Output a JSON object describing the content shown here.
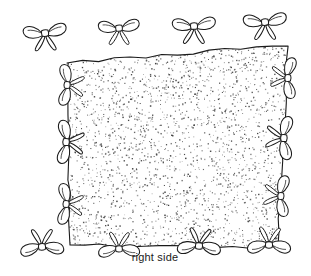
{
  "figure": {
    "caption": "right side",
    "caption_position": {
      "x": 155,
      "y": 261
    },
    "background_color": "#ffffff",
    "ink_color": "#1a1a1a",
    "stipple_color": "#3c3c3c",
    "line_width": 1.1
  },
  "panel": {
    "name": "stippled-fabric-panel",
    "description": "Rectangular fabric piece with hand-drawn wavy outline and dense random stipple fill",
    "fill": "#ffffff",
    "stipple_dot_count": 2400,
    "stipple_dot_size": 1.0,
    "corners": [
      {
        "name": "top-left",
        "x": 67,
        "y": 63
      },
      {
        "name": "top-right",
        "x": 288,
        "y": 45
      },
      {
        "name": "bottom-right",
        "x": 277,
        "y": 247
      },
      {
        "name": "bottom-left",
        "x": 70,
        "y": 245
      }
    ]
  },
  "bows": {
    "count_total": 14,
    "edges": [
      {
        "edge": "top",
        "count": 4,
        "orientation": "horizontal",
        "items": [
          {
            "name": "bow-top-1",
            "x": 45,
            "y": 33,
            "rotation": -6,
            "scale": 1.0
          },
          {
            "name": "bow-top-2",
            "x": 119,
            "y": 28,
            "rotation": -4,
            "scale": 0.95
          },
          {
            "name": "bow-top-3",
            "x": 194,
            "y": 26,
            "rotation": -3,
            "scale": 1.0
          },
          {
            "name": "bow-top-4",
            "x": 265,
            "y": 22,
            "rotation": -4,
            "scale": 1.0
          }
        ]
      },
      {
        "edge": "right",
        "count": 3,
        "orientation": "vertical",
        "items": [
          {
            "name": "bow-right-1",
            "x": 288,
            "y": 78,
            "rotation": 92,
            "scale": 0.95
          },
          {
            "name": "bow-right-2",
            "x": 284,
            "y": 138,
            "rotation": 92,
            "scale": 1.0
          },
          {
            "name": "bow-right-3",
            "x": 281,
            "y": 196,
            "rotation": 92,
            "scale": 0.95
          }
        ]
      },
      {
        "edge": "bottom",
        "count": 4,
        "orientation": "horizontal",
        "items": [
          {
            "name": "bow-bottom-1",
            "x": 42,
            "y": 247,
            "rotation": 176,
            "scale": 1.0
          },
          {
            "name": "bow-bottom-2",
            "x": 119,
            "y": 249,
            "rotation": 178,
            "scale": 0.95
          },
          {
            "name": "bow-bottom-3",
            "x": 199,
            "y": 246,
            "rotation": 182,
            "scale": 1.0
          },
          {
            "name": "bow-bottom-4",
            "x": 269,
            "y": 245,
            "rotation": 180,
            "scale": 1.0
          }
        ]
      },
      {
        "edge": "left",
        "count": 3,
        "orientation": "vertical",
        "items": [
          {
            "name": "bow-left-1",
            "x": 67,
            "y": 85,
            "rotation": 272,
            "scale": 0.95
          },
          {
            "name": "bow-left-2",
            "x": 66,
            "y": 142,
            "rotation": 272,
            "scale": 1.0
          },
          {
            "name": "bow-left-3",
            "x": 66,
            "y": 204,
            "rotation": 272,
            "scale": 0.95
          }
        ]
      }
    ]
  }
}
